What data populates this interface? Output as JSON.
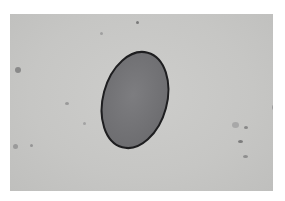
{
  "image": {
    "subject": "oval-egg-micrograph",
    "background_color": "#c7c7c5",
    "border_color": "#ffffff",
    "object": {
      "fill_color": "#77777a",
      "outline_color": "#1e1e20",
      "cx": 125,
      "cy": 86,
      "rx": 32,
      "ry": 49,
      "rotation_deg": 15
    },
    "specks": [
      {
        "x": 5,
        "y": 53,
        "w": 6,
        "h": 6,
        "color": "#8a8a8a"
      },
      {
        "x": 126,
        "y": 7,
        "w": 3,
        "h": 3,
        "color": "#7a7a7a"
      },
      {
        "x": 55,
        "y": 88,
        "w": 4,
        "h": 3,
        "color": "#999999"
      },
      {
        "x": 3,
        "y": 130,
        "w": 5,
        "h": 5,
        "color": "#9a9a9a"
      },
      {
        "x": 228,
        "y": 126,
        "w": 5,
        "h": 3,
        "color": "#7c7c7c"
      },
      {
        "x": 234,
        "y": 112,
        "w": 4,
        "h": 3,
        "color": "#888888"
      },
      {
        "x": 233,
        "y": 141,
        "w": 5,
        "h": 3,
        "color": "#8e8e8e"
      },
      {
        "x": 222,
        "y": 108,
        "w": 7,
        "h": 6,
        "color": "#a8a8a8"
      },
      {
        "x": 262,
        "y": 91,
        "w": 3,
        "h": 5,
        "color": "#9c9c9c"
      },
      {
        "x": 90,
        "y": 18,
        "w": 3,
        "h": 3,
        "color": "#a0a0a0"
      },
      {
        "x": 20,
        "y": 130,
        "w": 3,
        "h": 3,
        "color": "#959595"
      },
      {
        "x": 73,
        "y": 108,
        "w": 3,
        "h": 3,
        "color": "#a3a3a3"
      }
    ]
  }
}
